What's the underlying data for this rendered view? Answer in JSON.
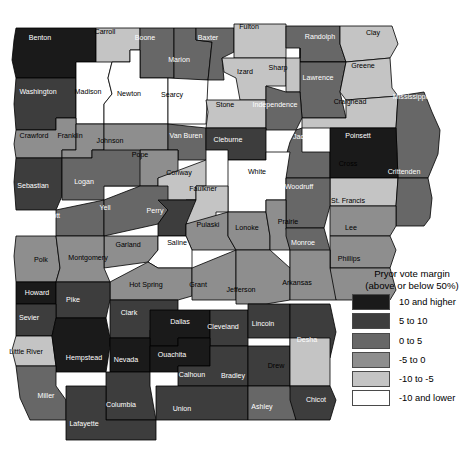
{
  "legend": {
    "title_line1": "Pryor vote margin",
    "title_line2": "(above or below 50%)",
    "entries": [
      {
        "label": "10 and higher",
        "color": "#1a1a1a",
        "key": "b5"
      },
      {
        "label": "5 to 10",
        "color": "#3d3d3d",
        "key": "b4"
      },
      {
        "label": "0 to 5",
        "color": "#676767",
        "key": "b3"
      },
      {
        "label": "-5 to 0",
        "color": "#8e8e8e",
        "key": "b2"
      },
      {
        "label": "-10 to -5",
        "color": "#c4c4c4",
        "key": "b1"
      },
      {
        "label": "-10 and lower",
        "color": "#ffffff",
        "key": "b0"
      }
    ]
  },
  "map": {
    "name": "Arkansas counties choropleth",
    "counties": [
      {
        "name": "Benton",
        "bin": "b5",
        "lx": 40,
        "ly": 38
      },
      {
        "name": "Carroll",
        "bin": "b1",
        "lx": 105,
        "ly": 32
      },
      {
        "name": "Boone",
        "bin": "b3",
        "lx": 145,
        "ly": 38
      },
      {
        "name": "Marion",
        "bin": "b3",
        "lx": 179,
        "ly": 60
      },
      {
        "name": "Baxter",
        "bin": "b3",
        "lx": 208,
        "ly": 38
      },
      {
        "name": "Fulton",
        "bin": "b1",
        "lx": 249,
        "ly": 27
      },
      {
        "name": "Randolph",
        "bin": "b3",
        "lx": 320,
        "ly": 37
      },
      {
        "name": "Clay",
        "bin": "b1",
        "lx": 373,
        "ly": 33
      },
      {
        "name": "Washington",
        "bin": "b4",
        "lx": 38,
        "ly": 92
      },
      {
        "name": "Madison",
        "bin": "b0",
        "lx": 88,
        "ly": 92
      },
      {
        "name": "Newton",
        "bin": "b0",
        "lx": 129,
        "ly": 94
      },
      {
        "name": "Searcy",
        "bin": "b0",
        "lx": 172,
        "ly": 95
      },
      {
        "name": "Izard",
        "bin": "b1",
        "lx": 245,
        "ly": 72
      },
      {
        "name": "Sharp",
        "bin": "b1",
        "lx": 278,
        "ly": 68
      },
      {
        "name": "Lawrence",
        "bin": "b3",
        "lx": 318,
        "ly": 78
      },
      {
        "name": "Greene",
        "bin": "b1",
        "lx": 363,
        "ly": 66
      },
      {
        "name": "Stone",
        "bin": "b1",
        "lx": 225,
        "ly": 105
      },
      {
        "name": "Independence",
        "bin": "b3",
        "lx": 275,
        "ly": 105
      },
      {
        "name": "Craighead",
        "bin": "b1",
        "lx": 350,
        "ly": 102
      },
      {
        "name": "Mississippi",
        "bin": "b3",
        "lx": 410,
        "ly": 97
      },
      {
        "name": "Crawford",
        "bin": "b2",
        "lx": 34,
        "ly": 136
      },
      {
        "name": "Franklin",
        "bin": "b2",
        "lx": 70,
        "ly": 136
      },
      {
        "name": "Johnson",
        "bin": "b2",
        "lx": 110,
        "ly": 141
      },
      {
        "name": "Van Buren",
        "bin": "b3",
        "lx": 186,
        "ly": 136
      },
      {
        "name": "Cleburne",
        "bin": "b4",
        "lx": 228,
        "ly": 140
      },
      {
        "name": "Jackson",
        "bin": "b3",
        "lx": 306,
        "ly": 137
      },
      {
        "name": "Poinsett",
        "bin": "b5",
        "lx": 358,
        "ly": 136
      },
      {
        "name": "Pope",
        "bin": "b2",
        "lx": 140,
        "ly": 155
      },
      {
        "name": "Conway",
        "bin": "b1",
        "lx": 179,
        "ly": 173
      },
      {
        "name": "White",
        "bin": "b0",
        "lx": 257,
        "ly": 172
      },
      {
        "name": "Cross",
        "bin": "b1",
        "lx": 348,
        "ly": 164
      },
      {
        "name": "Crittenden",
        "bin": "b3",
        "lx": 404,
        "ly": 172
      },
      {
        "name": "Sebastian",
        "bin": "b4",
        "lx": 33,
        "ly": 186
      },
      {
        "name": "Logan",
        "bin": "b3",
        "lx": 84,
        "ly": 182
      },
      {
        "name": "Faulkner",
        "bin": "b1",
        "lx": 203,
        "ly": 189
      },
      {
        "name": "Woodruff",
        "bin": "b3",
        "lx": 299,
        "ly": 187
      },
      {
        "name": "St. Francis",
        "bin": "b2",
        "lx": 348,
        "ly": 201
      },
      {
        "name": "Scott",
        "bin": "b3",
        "lx": 52,
        "ly": 216
      },
      {
        "name": "Yell",
        "bin": "b3",
        "lx": 105,
        "ly": 208
      },
      {
        "name": "Perry",
        "bin": "b4",
        "lx": 155,
        "ly": 211
      },
      {
        "name": "Pulaski",
        "bin": "b2",
        "lx": 208,
        "ly": 225
      },
      {
        "name": "Lonoke",
        "bin": "b2",
        "lx": 247,
        "ly": 228
      },
      {
        "name": "Prairie",
        "bin": "b2",
        "lx": 288,
        "ly": 222
      },
      {
        "name": "Lee",
        "bin": "b2",
        "lx": 351,
        "ly": 228
      },
      {
        "name": "Garland",
        "bin": "b2",
        "lx": 128,
        "ly": 245
      },
      {
        "name": "Saline",
        "bin": "b0",
        "lx": 177,
        "ly": 243
      },
      {
        "name": "Monroe",
        "bin": "b3",
        "lx": 303,
        "ly": 243
      },
      {
        "name": "Polk",
        "bin": "b2",
        "lx": 41,
        "ly": 260
      },
      {
        "name": "Montgomery",
        "bin": "b2",
        "lx": 88,
        "ly": 258
      },
      {
        "name": "Phillips",
        "bin": "b2",
        "lx": 349,
        "ly": 259
      },
      {
        "name": "Hot Spring",
        "bin": "b2",
        "lx": 146,
        "ly": 285
      },
      {
        "name": "Grant",
        "bin": "b2",
        "lx": 198,
        "ly": 285
      },
      {
        "name": "Jefferson",
        "bin": "b2",
        "lx": 241,
        "ly": 290
      },
      {
        "name": "Arkansas",
        "bin": "b2",
        "lx": 297,
        "ly": 283
      },
      {
        "name": "Howard",
        "bin": "b5",
        "lx": 37,
        "ly": 293
      },
      {
        "name": "Pike",
        "bin": "b4",
        "lx": 73,
        "ly": 300
      },
      {
        "name": "Clark",
        "bin": "b4",
        "lx": 129,
        "ly": 313
      },
      {
        "name": "Dallas",
        "bin": "b5",
        "lx": 180,
        "ly": 322
      },
      {
        "name": "Cleveland",
        "bin": "b4",
        "lx": 223,
        "ly": 327
      },
      {
        "name": "Lincoln",
        "bin": "b4",
        "lx": 263,
        "ly": 324
      },
      {
        "name": "Sevier",
        "bin": "b4",
        "lx": 29,
        "ly": 318
      },
      {
        "name": "Desha",
        "bin": "b4",
        "lx": 307,
        "ly": 340
      },
      {
        "name": "Little River",
        "bin": "b1",
        "lx": 26,
        "ly": 352
      },
      {
        "name": "Hempstead",
        "bin": "b5",
        "lx": 84,
        "ly": 358
      },
      {
        "name": "Nevada",
        "bin": "b5",
        "lx": 126,
        "ly": 360
      },
      {
        "name": "Ouachita",
        "bin": "b5",
        "lx": 172,
        "ly": 355
      },
      {
        "name": "Calhoun",
        "bin": "b4",
        "lx": 192,
        "ly": 375
      },
      {
        "name": "Bradley",
        "bin": "b4",
        "lx": 233,
        "ly": 376
      },
      {
        "name": "Drew",
        "bin": "b1",
        "lx": 276,
        "ly": 366
      },
      {
        "name": "Miller",
        "bin": "b3",
        "lx": 46,
        "ly": 396
      },
      {
        "name": "Columbia",
        "bin": "b4",
        "lx": 121,
        "ly": 405
      },
      {
        "name": "Union",
        "bin": "b4",
        "lx": 182,
        "ly": 409
      },
      {
        "name": "Ashley",
        "bin": "b3",
        "lx": 262,
        "ly": 407
      },
      {
        "name": "Chicot",
        "bin": "b4",
        "lx": 316,
        "ly": 400
      },
      {
        "name": "Lafayette",
        "bin": "b4",
        "lx": 84,
        "ly": 424
      }
    ]
  }
}
